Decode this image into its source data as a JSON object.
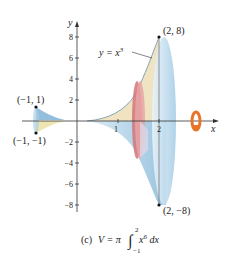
{
  "figure": {
    "curve_label": "y = x",
    "curve_exponent": "3",
    "points": [
      {
        "label": "(2, 8)"
      },
      {
        "label": "(2, −8)"
      },
      {
        "label": "(−1, 1)"
      },
      {
        "label": "(−1, −1)"
      }
    ],
    "axes": {
      "x_label": "x",
      "y_label": "y",
      "x_ticks": [
        "1",
        "2"
      ],
      "y_ticks": [
        "8",
        "6",
        "4",
        "2",
        "−2",
        "−4",
        "−6",
        "−8"
      ]
    },
    "caption": {
      "part": "(c)",
      "lhs": "V = π",
      "integrand": "x",
      "integrand_exp": "6",
      "differential": " dx",
      "upper": "2",
      "lower": "−1"
    },
    "colors": {
      "solid_blue": "#a9cfe6",
      "solid_tan": "#efe1bf",
      "disk_red": "#d2747a",
      "ring_orange": "#e8742a",
      "axis": "#333333"
    }
  }
}
